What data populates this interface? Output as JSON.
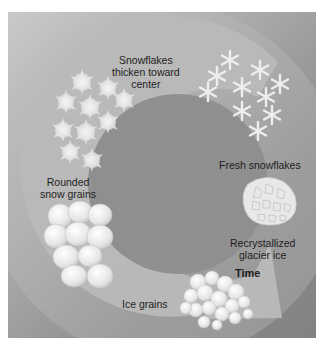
{
  "diagram": {
    "flow_direction": "counterclockwise, ending in arrow",
    "arrow_label": "Time",
    "stages": [
      {
        "id": "fresh",
        "label": "Fresh snowflakes",
        "order": 1
      },
      {
        "id": "thicken",
        "label_line1": "Snowflakes",
        "label_line2": "thicken toward",
        "label_line3": "center",
        "order": 2
      },
      {
        "id": "rounded",
        "label_line1": "Rounded",
        "label_line2": "snow grains",
        "order": 3
      },
      {
        "id": "ice",
        "label": "Ice grains",
        "order": 4
      },
      {
        "id": "glacier",
        "label_line1": "Recrystallized",
        "label_line2": "glacier ice",
        "order": 5
      }
    ],
    "colors": {
      "background_light": "#c9c9c9",
      "background_dark": "#828282",
      "arc": "#b8b8b8",
      "inner_disc": "#8f8f8f",
      "crystal": "#f2f2f2",
      "text": "#1e1e1e"
    }
  }
}
